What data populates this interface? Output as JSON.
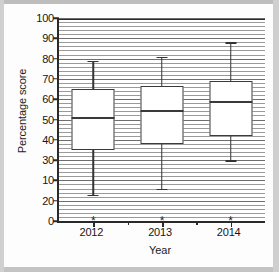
{
  "chart_data": {
    "type": "box",
    "title": "",
    "xlabel": "Year",
    "ylabel": "Percentage score",
    "categories": [
      "2012",
      "2013",
      "2014"
    ],
    "ylim": [
      0,
      100
    ],
    "y_tick_values": [
      100,
      90,
      80,
      70,
      60,
      50,
      40,
      30,
      10,
      20,
      0
    ],
    "y_tick_labels": [
      "100",
      "90",
      "80",
      "70",
      "60",
      "50",
      "40",
      "30",
      "10",
      "20",
      "0"
    ],
    "y_tick_note": "Labels at the 20 and 10 gridline positions are transposed in the source image (printed as 10 then 20 going downward); reproduced as shown.",
    "y_tick_positions": [
      100,
      90,
      80,
      70,
      60,
      50,
      40,
      30,
      20,
      10,
      0
    ],
    "grid": "horizontal dense",
    "legend": "none",
    "boxes": [
      {
        "category": "2012",
        "whisker_low": 13,
        "q1": 35,
        "median": 51,
        "q3": 65,
        "whisker_high": 79,
        "outliers": [
          0
        ]
      },
      {
        "category": "2013",
        "whisker_low": 16,
        "q1": 38,
        "median": 54.5,
        "q3": 66.5,
        "whisker_high": 81,
        "outliers": [
          0
        ]
      },
      {
        "category": "2014",
        "whisker_low": 30,
        "q1": 42,
        "median": 59,
        "q3": 69,
        "whisker_high": 88,
        "outliers": [
          0
        ]
      }
    ],
    "outlier_marker": "*",
    "colors": {
      "axis": "#2a2a2a",
      "box_edge": "#3a3a3a",
      "box_fill": "#ffffff",
      "gridline": "#9a9a9a",
      "text": "#161616",
      "background": "#ffffff"
    }
  }
}
